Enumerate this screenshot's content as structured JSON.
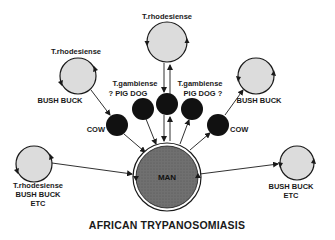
{
  "title": "AFRICAN TRYPANOSOMIASIS",
  "center_node": {
    "label": "MAN",
    "fill": "#6e6e6e"
  },
  "reservoir_cycles": [
    {
      "id": "top",
      "species": "T.rhodesiense",
      "host": ""
    },
    {
      "id": "upper-left",
      "species": "T.rhodesiense",
      "host": "BUSH BUCK"
    },
    {
      "id": "upper-right",
      "species": "",
      "host": "BUSH BUCK"
    },
    {
      "id": "lower-left",
      "species": "T.rhodesiense",
      "host": "BUSH BUCK",
      "host_extra": "ETC"
    },
    {
      "id": "lower-right",
      "species": "",
      "host": "BUSH BUCK",
      "host_extra": "ETC"
    }
  ],
  "intermediate_hosts": {
    "left_cow": "COW",
    "right_cow": "COW",
    "left_group": {
      "species": "T.gambiense",
      "hosts": "? PIG  DOG"
    },
    "right_group": {
      "species": "T.gambiense",
      "hosts": "PIG  DOG  ?"
    }
  },
  "colors": {
    "cycle_fill": "#dcdcdc",
    "host_dot": "#111111",
    "man_fill": "#6e6e6e",
    "line": "#1a1a1a"
  }
}
